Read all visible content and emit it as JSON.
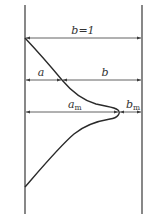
{
  "diagram": {
    "type": "velocity-profile-between-walls",
    "colors": {
      "line": "#3a3a3a",
      "curve": "#2a2a2a",
      "text": "#333333",
      "background": "#ffffff"
    },
    "walls": {
      "left_x": 25,
      "right_x": 142,
      "top_y": 5,
      "bottom_y": 214
    },
    "dimensions": [
      {
        "id": "total-width",
        "label": "b=1",
        "y": 38,
        "from_x": 25,
        "to_x": 142
      },
      {
        "id": "a",
        "label": "a",
        "y": 80,
        "from_x": 25,
        "to_x": 62
      },
      {
        "id": "b",
        "label": "b",
        "y": 80,
        "from_x": 62,
        "to_x": 142
      },
      {
        "id": "a-m",
        "label_main": "a",
        "label_sub": "m",
        "y": 112,
        "from_x": 25,
        "to_x": 119
      },
      {
        "id": "b-m",
        "label_main": "b",
        "label_sub": "m",
        "y": 112,
        "from_x": 119,
        "to_x": 142
      }
    ],
    "labels": {
      "total": "b=1",
      "a": "a",
      "b": "b",
      "am_main": "a",
      "am_sub": "m",
      "bm_main": "b",
      "bm_sub": "m"
    }
  }
}
